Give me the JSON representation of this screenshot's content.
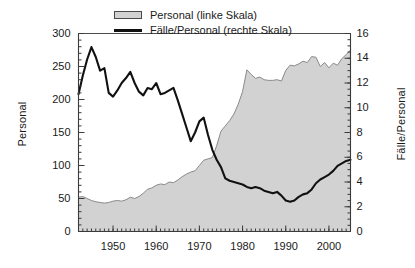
{
  "chart_data": {
    "type": "area",
    "title": "",
    "subtitle": "",
    "xlabel": "",
    "ylabel": "Personal",
    "y2label": "Fälle/Personal",
    "xlim": [
      1942,
      2005
    ],
    "ylim": [
      0,
      300
    ],
    "y2lim": [
      0,
      16
    ],
    "grid": false,
    "legend_position": "top-center",
    "x_ticks": [
      1950,
      1960,
      1970,
      1980,
      1990,
      2000
    ],
    "x_tick_labels": [
      "1950",
      "1960",
      "1970",
      "1980",
      "1990",
      "2000"
    ],
    "x_minor_tick_step": 1,
    "y_ticks": [
      0,
      50,
      100,
      150,
      200,
      250,
      300
    ],
    "y_tick_labels": [
      "0",
      "50",
      "100",
      "150",
      "200",
      "250",
      "300"
    ],
    "y_minor_tick_step": 10,
    "y2_ticks": [
      0,
      2,
      4,
      6,
      8,
      10,
      12,
      14,
      16
    ],
    "y2_tick_labels": [
      "0",
      "2",
      "4",
      "6",
      "8",
      "10",
      "12",
      "14",
      "16"
    ],
    "y2_minor_tick_step": 0.5,
    "colors": {
      "area_fill": "#d2d2d2",
      "area_edge": "#8a8a8a",
      "line": "#111111",
      "axis": "#3a3a3a",
      "background": "#ffffff"
    },
    "x": [
      1942,
      1943,
      1944,
      1945,
      1946,
      1947,
      1948,
      1949,
      1950,
      1951,
      1952,
      1953,
      1954,
      1955,
      1956,
      1957,
      1958,
      1959,
      1960,
      1961,
      1962,
      1963,
      1964,
      1965,
      1966,
      1967,
      1968,
      1969,
      1970,
      1971,
      1972,
      1973,
      1974,
      1975,
      1976,
      1977,
      1978,
      1979,
      1980,
      1981,
      1982,
      1983,
      1984,
      1985,
      1986,
      1987,
      1988,
      1989,
      1990,
      1991,
      1992,
      1993,
      1994,
      1995,
      1996,
      1997,
      1998,
      1999,
      2000,
      2001,
      2002,
      2003,
      2004,
      2005
    ],
    "series": [
      {
        "name": "Personal (linke Skala)",
        "axis": "left",
        "style": "filled-area",
        "unit": "Personal",
        "values": [
          52,
          53,
          50,
          47,
          45,
          44,
          43,
          44,
          46,
          47,
          46,
          48,
          52,
          50,
          53,
          58,
          64,
          66,
          70,
          72,
          71,
          75,
          74,
          78,
          83,
          87,
          90,
          92,
          100,
          108,
          110,
          112,
          130,
          152,
          160,
          168,
          178,
          193,
          212,
          245,
          238,
          232,
          234,
          230,
          229,
          229,
          230,
          228,
          244,
          252,
          251,
          254,
          258,
          256,
          265,
          264,
          250,
          256,
          248,
          255,
          252,
          262,
          268,
          275
        ]
      },
      {
        "name": "Fälle/Personal (rechte Skala)",
        "axis": "right",
        "style": "line",
        "unit": "Fälle/Personal",
        "values": [
          11.1,
          12.6,
          13.9,
          14.9,
          14.1,
          13.0,
          13.2,
          11.2,
          10.9,
          11.4,
          12.0,
          12.4,
          12.9,
          12.0,
          11.3,
          11.0,
          11.6,
          11.5,
          12.0,
          11.1,
          11.2,
          11.4,
          11.6,
          10.6,
          9.5,
          8.4,
          7.3,
          8.0,
          8.9,
          9.2,
          7.8,
          6.6,
          5.8,
          5.2,
          4.3,
          4.1,
          4.0,
          3.9,
          3.8,
          3.6,
          3.5,
          3.6,
          3.5,
          3.3,
          3.2,
          3.1,
          3.2,
          2.9,
          2.5,
          2.4,
          2.5,
          2.8,
          3.0,
          3.1,
          3.4,
          3.9,
          4.2,
          4.4,
          4.6,
          4.9,
          5.3,
          5.5,
          5.7,
          5.8
        ]
      }
    ]
  },
  "legend": {
    "entries": [
      {
        "label": "Personal (linke Skala)",
        "key": "area-swatch"
      },
      {
        "label": "Fälle/Personal (rechte Skala)",
        "key": "line-swatch"
      }
    ]
  },
  "axes": {
    "left_title": "Personal",
    "right_title": "Fälle/Personal"
  }
}
